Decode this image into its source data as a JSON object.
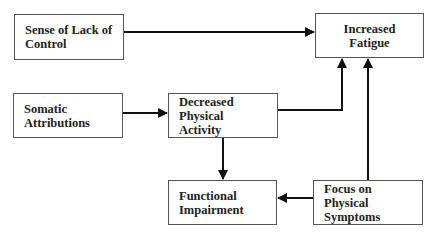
{
  "diagram": {
    "nodes": [
      {
        "id": "lack_of_control",
        "line1": "Sense of Lack of",
        "line2": "Control"
      },
      {
        "id": "increased_fatigue",
        "line1": "Increased Fatigue",
        "line2": ""
      },
      {
        "id": "somatic_attributions",
        "line1": "Somatic",
        "line2": "Attributions"
      },
      {
        "id": "decreased_activity",
        "line1": "Decreased",
        "line2": "Physical Activity"
      },
      {
        "id": "functional_impairment",
        "line1": "Functional",
        "line2": "Impairment"
      },
      {
        "id": "focus_symptoms",
        "line1": "Focus on Physical",
        "line2": "Symptoms"
      }
    ],
    "edges": [
      {
        "from": "lack_of_control",
        "to": "increased_fatigue"
      },
      {
        "from": "somatic_attributions",
        "to": "decreased_activity"
      },
      {
        "from": "decreased_activity",
        "to": "increased_fatigue"
      },
      {
        "from": "focus_symptoms",
        "to": "increased_fatigue"
      },
      {
        "from": "decreased_activity",
        "to": "functional_impairment"
      },
      {
        "from": "focus_symptoms",
        "to": "functional_impairment"
      }
    ],
    "colors": {
      "line": "#111111",
      "border": "#555555",
      "text": "#222222"
    }
  }
}
